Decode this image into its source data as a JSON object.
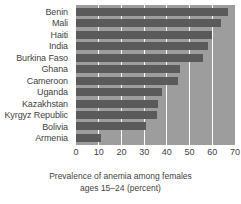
{
  "chart_data": {
    "type": "bar",
    "orientation": "horizontal",
    "title": "",
    "xlabel": "Prevalence of anemia among females ages 15–24 (percent)",
    "ylabel": "",
    "categories": [
      "Benin",
      "Mali",
      "Haiti",
      "India",
      "Burkina Faso",
      "Ghana",
      "Cameroon",
      "Uganda",
      "Kazakhstan",
      "Kyrgyz Republic",
      "Bolivia",
      "Armenia"
    ],
    "values": [
      67,
      64,
      60,
      58,
      56,
      46,
      45,
      38,
      36,
      35.5,
      31,
      11
    ],
    "xlim": [
      0,
      70
    ],
    "xticks": [
      0,
      10,
      20,
      30,
      40,
      50,
      60,
      70
    ],
    "grid": true,
    "legend": "none",
    "colors": {
      "bar": "#5a5a5a",
      "plot_background": "#9d9d9d",
      "gridline": "#ffffff",
      "text": "#3f3f3f",
      "page_background": "#ffffff"
    }
  },
  "axis": {
    "title_line1": "Prevalence of anemia among females",
    "title_line2": "ages 15–24 (percent)",
    "tick_labels": [
      "0",
      "10",
      "20",
      "30",
      "40",
      "50",
      "60",
      "70"
    ]
  }
}
